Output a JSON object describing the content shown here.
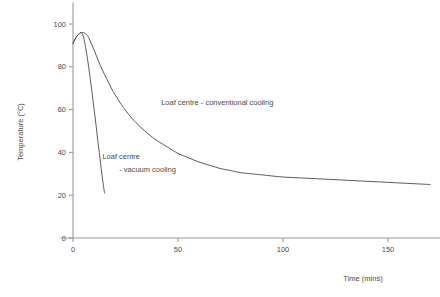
{
  "chart_data": {
    "type": "line",
    "title": "",
    "xlabel": "Time (mins)",
    "ylabel": "Temperature (°C)",
    "xlim": [
      -6,
      175
    ],
    "ylim": [
      0,
      110
    ],
    "xticks": [
      0,
      50,
      100,
      150
    ],
    "xtick_labels": [
      "0",
      "50",
      "100",
      "150"
    ],
    "yticks": [
      0,
      20,
      40,
      60,
      80,
      100
    ],
    "ytick_labels": [
      "0",
      "20",
      "40",
      "60",
      "80",
      "100"
    ],
    "grid": false,
    "legend": "none",
    "annotations": [
      {
        "name": "conventional-cooling-label",
        "text": "Loaf centre - conventional cooling",
        "x": 42,
        "y": 62
      },
      {
        "name": "vacuum-cooling-label-line1",
        "text": "Loaf centre",
        "x": 14,
        "y": 37
      },
      {
        "name": "vacuum-cooling-label-line2",
        "text": "- vacuum cooling",
        "x": 22,
        "y": 31
      }
    ],
    "series": [
      {
        "name": "Loaf centre - conventional cooling",
        "color": "#4a4a4a",
        "x": [
          0,
          1,
          2,
          3,
          4,
          5,
          6,
          7,
          8,
          10,
          12,
          14,
          16,
          18,
          20,
          24,
          28,
          32,
          36,
          40,
          45,
          50,
          55,
          60,
          65,
          70,
          75,
          80,
          85,
          90,
          100,
          110,
          120,
          130,
          140,
          150,
          160,
          170
        ],
        "y": [
          91,
          93,
          94.5,
          95.5,
          96,
          96,
          95.5,
          94.5,
          92.5,
          88,
          83,
          78.5,
          74.5,
          70.5,
          67,
          61,
          56,
          52,
          48.5,
          45.5,
          42.5,
          39.5,
          37.5,
          35.5,
          34,
          32.5,
          31.5,
          30.5,
          30,
          29.5,
          28.5,
          28,
          27.5,
          27,
          26.5,
          26,
          25.5,
          25
        ]
      },
      {
        "name": "Loaf centre - vacuum cooling",
        "color": "#4a4a4a",
        "x": [
          0,
          1,
          2,
          3,
          4,
          5,
          6,
          7,
          8,
          9,
          10,
          11,
          12,
          13,
          14,
          15
        ],
        "y": [
          91,
          93,
          94.5,
          95.5,
          96,
          94,
          89,
          83,
          76,
          68.5,
          60.5,
          52.5,
          44,
          36,
          28,
          21
        ]
      }
    ]
  }
}
